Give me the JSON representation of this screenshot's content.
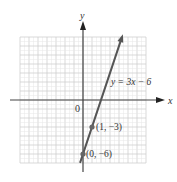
{
  "chart_data": {
    "type": "line",
    "title": "",
    "xlabel": "x",
    "ylabel": "y",
    "origin_label": "0",
    "xlim": [
      -7,
      7
    ],
    "ylim": [
      -7,
      7
    ],
    "grid": true,
    "grid_minor_step": 0.5,
    "series": [
      {
        "name": "y = 3x − 6",
        "equation": "y = 3x − 6",
        "slope": 3,
        "intercept": -6,
        "x_range": [
          -0.33,
          4.3
        ],
        "color": "#555555"
      }
    ],
    "points": [
      {
        "x": 1,
        "y": -3,
        "label": "(1, −3)"
      },
      {
        "x": 0,
        "y": -6,
        "label": "(0, −6)"
      }
    ],
    "annotations": [
      {
        "text": "y = 3x − 6",
        "near": [
          3.1,
          2
        ]
      }
    ]
  },
  "labels": {
    "x_axis": "x",
    "y_axis": "y",
    "origin": "0",
    "equation": "y = 3x − 6",
    "point1": "(1, −3)",
    "point2": "(0, −6)"
  }
}
